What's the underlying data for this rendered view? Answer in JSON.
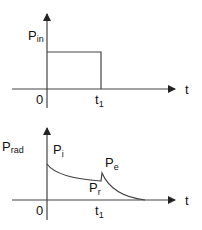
{
  "top_graph": {
    "y_label": "P",
    "y_label_sub": "in",
    "x_label": "t",
    "origin_label": "0",
    "t1_label": "t",
    "t1_sub": "1"
  },
  "bottom_graph": {
    "y_label": "P",
    "y_label_sub": "rad",
    "x_label": "t",
    "origin_label": "0",
    "t1_label": "t",
    "t1_sub": "1",
    "pi_label": "P",
    "pi_sub": "i",
    "pe_label": "P",
    "pe_sub": "e",
    "pr_label": "P",
    "pr_sub": "r"
  },
  "colors": {
    "line": "#444444",
    "text": "#111111"
  }
}
